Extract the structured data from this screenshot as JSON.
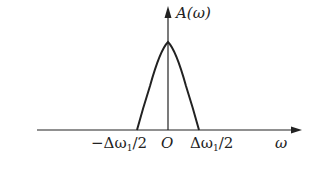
{
  "diagram": {
    "type": "spectrum-plot",
    "y_axis_label": "A(ω)",
    "x_axis_label": "ω",
    "origin_label": "O",
    "ticks": {
      "left": "−Δω",
      "left_sub": "1",
      "left_tail": "/2",
      "right": "Δω",
      "right_sub": "1",
      "right_tail": "/2"
    },
    "curve": {
      "shape": "parabolic-peak",
      "support": [
        "-Δω1/2",
        "Δω1/2"
      ],
      "peak_at": 0
    },
    "colors": {
      "stroke": "#222222",
      "background": "#ffffff"
    }
  }
}
